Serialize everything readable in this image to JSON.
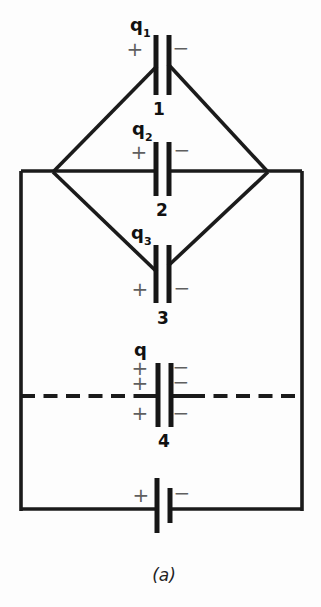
{
  "figure": {
    "caption": "(a)",
    "capacitors": [
      {
        "charge": "q",
        "charge_subscript": "1",
        "number": "1",
        "plus": "+",
        "minus": "−"
      },
      {
        "charge": "q",
        "charge_subscript": "2",
        "number": "2",
        "plus": "+",
        "minus": "−"
      },
      {
        "charge": "q",
        "charge_subscript": "3",
        "number": "3",
        "plus": "+",
        "minus": "−"
      },
      {
        "charge": "q",
        "number": "4",
        "plus_signs": [
          "+",
          "+",
          "+"
        ],
        "minus_signs": [
          "−",
          "−",
          "−"
        ]
      }
    ],
    "battery": {
      "plus": "+",
      "minus": "−"
    },
    "colors": {
      "line": "#1b1b1b",
      "sign_gray": "#5f5f5f",
      "background": "#fdfdfd"
    }
  }
}
